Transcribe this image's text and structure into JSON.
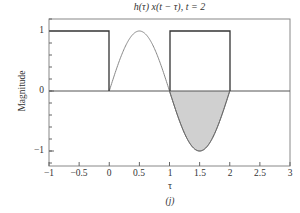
{
  "chart_data": {
    "type": "line",
    "title": "h(τ) x(t − τ), t = 2",
    "xlabel": "τ",
    "ylabel": "Magnitude",
    "caption": "(j)",
    "xlim": [
      -1,
      3
    ],
    "ylim": [
      -1.2,
      1.2
    ],
    "xticks": [
      "−1",
      "−0.5",
      "0",
      "0.5",
      "1",
      "1.5",
      "2",
      "2.5",
      "3"
    ],
    "yticks": [
      "1",
      "0",
      "−1"
    ],
    "grid": false,
    "series": [
      {
        "name": "x(t − τ) rectangular pulses",
        "style": "dark solid",
        "segments": [
          {
            "x": [
              -1,
              0,
              0
            ],
            "y": [
              1,
              1,
              0
            ]
          },
          {
            "x": [
              1,
              1,
              2,
              2
            ],
            "y": [
              0,
              1,
              1,
              0
            ]
          }
        ]
      },
      {
        "name": "h(τ) sine",
        "style": "gray thin",
        "x": [
          0,
          0.25,
          0.5,
          0.75,
          1,
          1.25,
          1.5,
          1.75,
          2
        ],
        "y": [
          0,
          0.707,
          1,
          0.707,
          0,
          -0.707,
          -1,
          -0.707,
          0
        ]
      },
      {
        "name": "product area (shaded)",
        "style": "gray fill",
        "x_range": [
          1,
          2
        ],
        "y_min": -1
      }
    ],
    "zero_line": true
  }
}
